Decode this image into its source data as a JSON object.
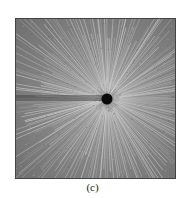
{
  "figure": {
    "caption": "(c)",
    "colors": {
      "background": "#8a8a8a",
      "ray": "#d8d8d8",
      "dot": "#0a0a0a"
    }
  }
}
